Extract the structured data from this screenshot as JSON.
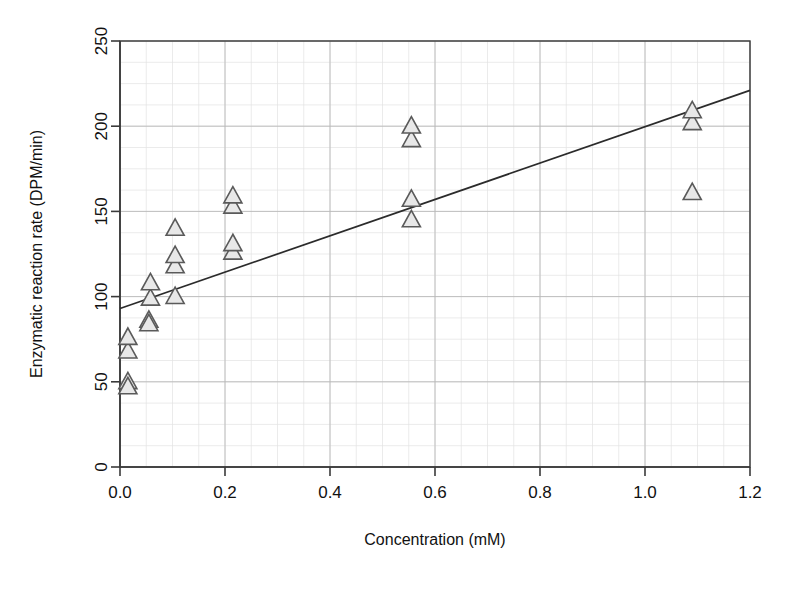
{
  "figure": {
    "background": "#ffffff",
    "marker_fill": "#e8e8e8",
    "marker_stroke": "#5a5a5a",
    "line_color": "#2b2b2b",
    "grid_major_color": "#b9b9b9",
    "grid_minor_color": "#e2e2e2"
  },
  "chart_data": {
    "type": "scatter",
    "title": "",
    "subtitle": "",
    "xlabel": "Concentration (mM)",
    "ylabel": "Enzymatic reaction rate (DPM/min)",
    "xlim": [
      0.0,
      1.2
    ],
    "ylim": [
      0,
      250
    ],
    "xticks": [
      0.0,
      0.2,
      0.4,
      0.6,
      0.8,
      1.0,
      1.2
    ],
    "xticklabels": [
      "0.0",
      "0.2",
      "0.4",
      "0.6",
      "0.8",
      "1.0",
      "1.2"
    ],
    "yticks": [
      0,
      50,
      100,
      150,
      200,
      250
    ],
    "yticklabels": [
      "0",
      "50",
      "100",
      "150",
      "200",
      "250"
    ],
    "x_minor_step": 0.05,
    "y_minor_step": 12.5,
    "grid": true,
    "grid_minor": true,
    "legend": false,
    "legend_position": "none",
    "marker": "triangle-up",
    "series": [
      {
        "name": "Enzyme assay replicates",
        "marker": "triangle-up",
        "points": [
          {
            "x": 0.015,
            "y": 50
          },
          {
            "x": 0.015,
            "y": 47
          },
          {
            "x": 0.015,
            "y": 68
          },
          {
            "x": 0.015,
            "y": 76
          },
          {
            "x": 0.055,
            "y": 86
          },
          {
            "x": 0.055,
            "y": 84
          },
          {
            "x": 0.058,
            "y": 99
          },
          {
            "x": 0.058,
            "y": 108
          },
          {
            "x": 0.105,
            "y": 100
          },
          {
            "x": 0.105,
            "y": 118
          },
          {
            "x": 0.105,
            "y": 124
          },
          {
            "x": 0.105,
            "y": 140
          },
          {
            "x": 0.215,
            "y": 126
          },
          {
            "x": 0.215,
            "y": 131
          },
          {
            "x": 0.215,
            "y": 153
          },
          {
            "x": 0.215,
            "y": 159
          },
          {
            "x": 0.555,
            "y": 145
          },
          {
            "x": 0.555,
            "y": 157
          },
          {
            "x": 0.555,
            "y": 192
          },
          {
            "x": 0.555,
            "y": 200
          },
          {
            "x": 1.09,
            "y": 161
          },
          {
            "x": 1.09,
            "y": 202
          },
          {
            "x": 1.09,
            "y": 209
          }
        ]
      }
    ],
    "fit_line": {
      "name": "linear regression",
      "x0": 0.0,
      "y0": 93,
      "x1": 1.2,
      "y1": 221,
      "slope": 106.7,
      "intercept": 93
    }
  },
  "caption": {
    "text": ""
  }
}
